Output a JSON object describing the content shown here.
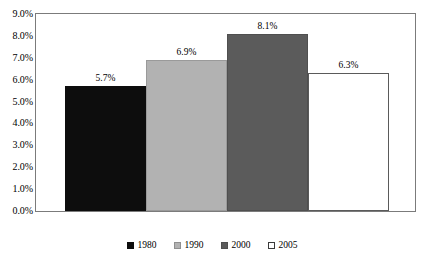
{
  "chart_data": {
    "type": "bar",
    "title": "",
    "subtitle": "",
    "xlabel": "",
    "ylabel": "",
    "categories": [
      "1980",
      "1990",
      "2000",
      "2005"
    ],
    "values": [
      5.7,
      6.9,
      8.1,
      6.3
    ],
    "value_labels": [
      "5.7%",
      "6.9%",
      "8.1%",
      "6.3%"
    ],
    "ylim": [
      0,
      9
    ],
    "ytick_labels": [
      "0.0%",
      "1.0%",
      "2.0%",
      "3.0%",
      "4.0%",
      "5.0%",
      "6.0%",
      "7.0%",
      "8.0%",
      "9.0%"
    ],
    "ytick_values": [
      0,
      1,
      2,
      3,
      4,
      5,
      6,
      7,
      8,
      9
    ],
    "xtick_labels": [],
    "grid": false,
    "legend_position": "bottom",
    "legend": [
      {
        "label": "1980",
        "color": "#0d0d0d"
      },
      {
        "label": "1990",
        "color": "#b2b2b2"
      },
      {
        "label": "2000",
        "color": "#5b5b5b"
      },
      {
        "label": "2005",
        "color": "#ffffff"
      }
    ],
    "series": [
      {
        "name": "Share",
        "values": [
          5.7,
          6.9,
          8.1,
          6.3
        ]
      }
    ]
  }
}
